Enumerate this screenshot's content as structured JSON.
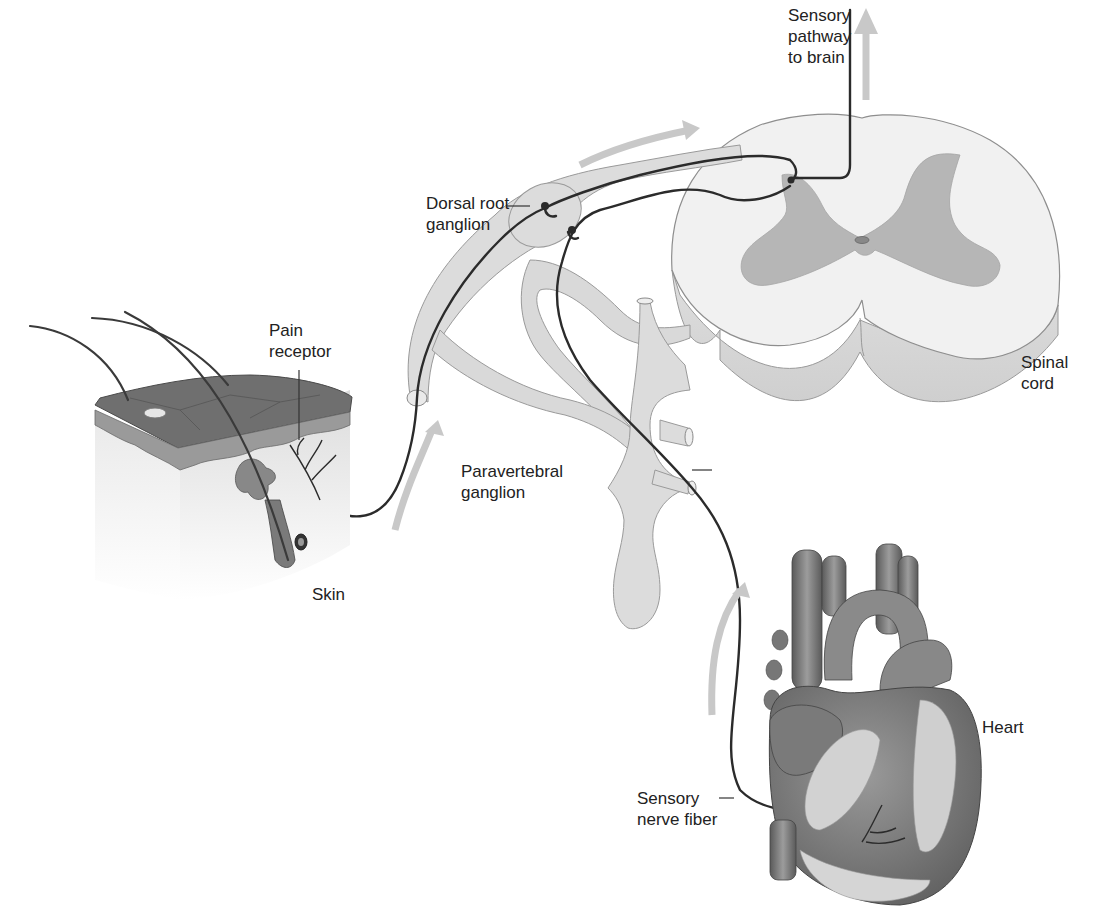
{
  "diagram": {
    "type": "anatomical-illustration",
    "colors": {
      "background": "#ffffff",
      "nerve_fiber": "#2b2b2b",
      "nerve_sheath": "#d9d9d9",
      "sheath_outline": "#9a9a9a",
      "flow_arrow": "#c8c8c8",
      "gray_matter": "#b5b5b5",
      "white_matter": "#eeeeee",
      "skin_top": "#6e6e6e",
      "skin_side": "#e4e4e4",
      "heart": "#7d7d7d",
      "heart_fat": "#d0d0d0",
      "label_text": "#222222"
    },
    "labels": {
      "sensory_pathway": "Sensory\npathway\nto brain",
      "dorsal_root_ganglion": "Dorsal root\nganglion",
      "pain_receptor": "Pain\nreceptor",
      "spinal_cord": "Spinal\ncord",
      "paravertebral_ganglion": "Paravertebral\nganglion",
      "skin": "Skin",
      "heart": "Heart",
      "sensory_nerve_fiber": "Sensory\nnerve fiber"
    },
    "structures": [
      "spinal-cord-cross-section",
      "dorsal-root-ganglion",
      "paravertebral-ganglion",
      "skin-block",
      "hair-follicle",
      "pain-receptor",
      "heart",
      "sensory-nerve-fibers",
      "flow-arrows"
    ]
  }
}
